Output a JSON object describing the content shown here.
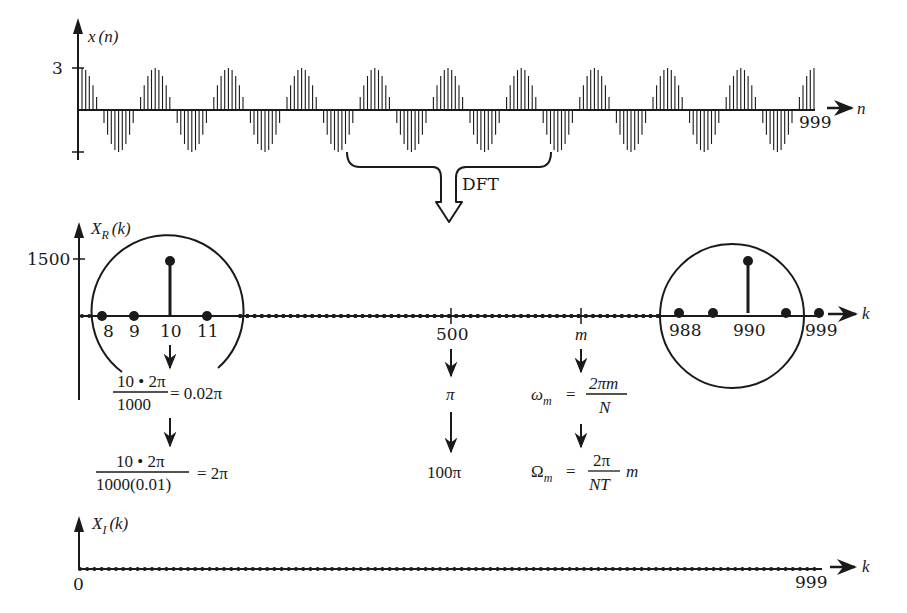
{
  "colors": {
    "ink": "#1a1a1a",
    "background": "#ffffff"
  },
  "top_plot": {
    "ylabel": "x(n)",
    "ylabel_main": "x",
    "ylabel_arg": "(n)",
    "ytick_label": "3",
    "xlabel": "n",
    "x_end_label": "999"
  },
  "transform": {
    "label": "DFT"
  },
  "real_plot": {
    "ylabel_main": "X",
    "ylabel_sub": "R",
    "ylabel_arg": "(k)",
    "ytick_label": "1500",
    "xlabel": "k",
    "tick_labels": {
      "k8": "8",
      "k9": "9",
      "k10": "10",
      "k11": "11",
      "k500": "500",
      "km": "m",
      "k988": "988",
      "k990": "990",
      "k999": "999"
    }
  },
  "annotations": {
    "left": {
      "line1_num": "10 • 2π",
      "line1_den": "1000",
      "line1_result": "= 0.02π",
      "line2_num": "10 • 2π",
      "line2_den": "1000(0.01)",
      "line2_result": "= 2π"
    },
    "middle": {
      "line1": "π",
      "line2": "100π"
    },
    "right": {
      "omega_lhs": "ω",
      "omega_sub": "m",
      "omega_eq": "=",
      "omega_num": "2πm",
      "omega_den": "N",
      "Omega_lhs": "Ω",
      "Omega_sub": "m",
      "Omega_eq": "=",
      "Omega_num": "2π",
      "Omega_den": "NT",
      "Omega_tail": "m"
    }
  },
  "imag_plot": {
    "ylabel_main": "X",
    "ylabel_sub": "I",
    "ylabel_arg": "(k)",
    "xlabel": "k",
    "x_start_label": "0",
    "x_end_label": "999"
  },
  "chart_data": [
    {
      "type": "stem",
      "title": "x(n)",
      "xlabel": "n",
      "ylabel": "x(n)",
      "x_range": [
        0,
        999
      ],
      "amplitude": 3,
      "description": "Sampled cosine x(n) = 3cos(2π·10n/1000), about 11 visible periods across the span n = 0..999",
      "yticks": [
        3,
        -3
      ]
    },
    {
      "type": "stem",
      "title": "X_R(k)",
      "xlabel": "k",
      "ylabel": "X_R(k)",
      "x_range": [
        0,
        999
      ],
      "yticks": [
        1500
      ],
      "points": [
        {
          "k": 10,
          "value": 1500
        },
        {
          "k": 990,
          "value": 1500
        }
      ],
      "other_values": 0,
      "labeled_ticks": [
        "8",
        "9",
        "10",
        "11",
        "500",
        "m",
        "988",
        "990",
        "999"
      ],
      "highlighted_regions": [
        "around k=10 (circle)",
        "around k=990 (circle)"
      ]
    },
    {
      "type": "stem",
      "title": "X_I(k)",
      "xlabel": "k",
      "ylabel": "X_I(k)",
      "x_range": [
        0,
        999
      ],
      "all_values": 0,
      "labeled_ticks": [
        "0",
        "999"
      ]
    }
  ]
}
